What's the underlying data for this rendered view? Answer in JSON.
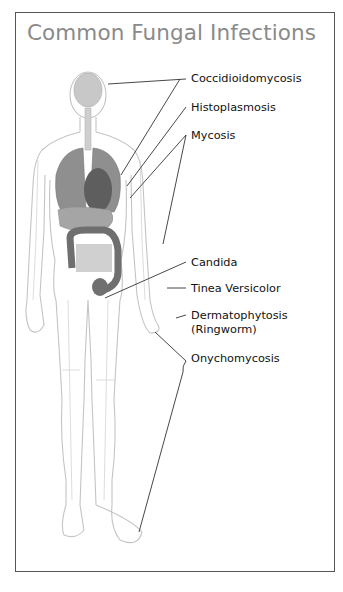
{
  "title": "Common Fungal Infections",
  "labels": [
    {
      "id": "coccidioidomycosis",
      "text": "Coccidioidomycosis",
      "region": "brain"
    },
    {
      "id": "histoplasmosis",
      "text": "Histoplasmosis",
      "region": "lungs"
    },
    {
      "id": "mycosis",
      "text": "Mycosis",
      "region": "lungs / arm"
    },
    {
      "id": "candida",
      "text": "Candida",
      "region": "intestines"
    },
    {
      "id": "tinea-versicolor",
      "text": "Tinea Versicolor",
      "region": "skin (arm)"
    },
    {
      "id": "dermatophytosis",
      "text": "Dermatophytosis",
      "text2": "(Ringworm)",
      "region": "hand"
    },
    {
      "id": "onychomycosis",
      "text": "Onychomycosis",
      "region": "nails (hand / foot)"
    }
  ],
  "colors": {
    "title": "#8a8a8a",
    "frame": "#555555",
    "body_outline": "#bdbdbd",
    "organs_light": "#b9b9b9",
    "organs_dark": "#6e6e6e",
    "leader_line": "#333333"
  }
}
